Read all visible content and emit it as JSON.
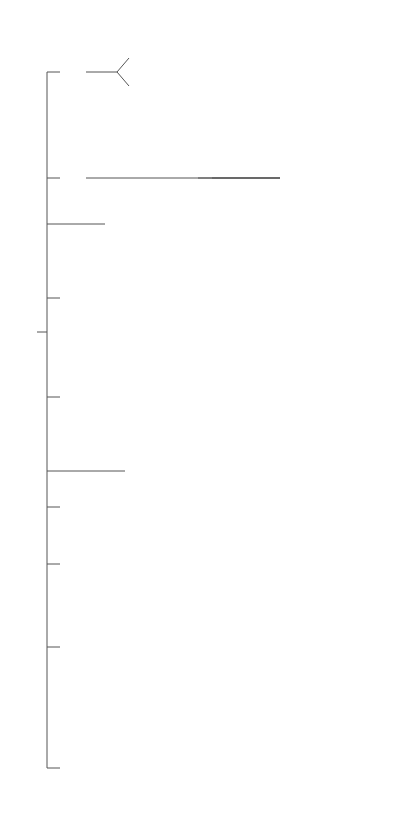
{
  "root": {
    "label": "Quantitative methods"
  },
  "categories": {
    "network": {
      "label": "Network\nprogramming",
      "children": [
        "PERT",
        "CPM"
      ]
    },
    "hybrid": {
      "label": "Hybrid\ntechniques",
      "children": [
        "Dynamic\nprogramming",
        "Heuristic\nprogramming",
        "Stock control"
      ]
    },
    "causal": {
      "label": "Causal\nmodels",
      "children": [
        "Linear\nstructure\nrelations\n(LISREL)",
        "Path\nanalysis"
      ]
    },
    "deterministic": {
      "label": "Deterministic\noperational\nresearch\nmethods",
      "children": [
        "Transportation\nmodel",
        "Linear\nnon-linear"
      ]
    },
    "statistical": {
      "label": "Statistical decision\ntheory (or stochastic\nmethods)",
      "children": [
        "Queuing",
        "Stochastic\nprocesses",
        "Statistical\ndesign theory",
        "Game\ntheory"
      ]
    },
    "ai": {
      "label": "Artificial\nintelligence\n(AI)",
      "children": [
        "Neural\nnetworks",
        "Expert\nsystems"
      ]
    },
    "fuzzy": {
      "label": "Fuzzy\nsets"
    },
    "simulation": {
      "label": "Simulation"
    },
    "regression": {
      "label": "Regression\nand forecasting\ntechniques",
      "children": [
        "Multiple\nregression",
        "Discriminant\nanalysis",
        "Automatic\ninteraction\ndetection\n(AID)",
        "Multivariate\nmethods"
      ]
    },
    "multivariate": {
      "label": "Multivariate\nmethods",
      "children": [
        "Factor\nanalysis",
        "Cluster\nanalysis",
        "Multi-dimensional\nscaling",
        "Latent\nanalysis"
      ],
      "mds_children": [
        "Correspondence\nanalysis",
        "Conjoint\nanalysis"
      ]
    }
  },
  "colors": {
    "line": "#555555",
    "text": "#3a3a3a",
    "background": "#ffffff"
  }
}
